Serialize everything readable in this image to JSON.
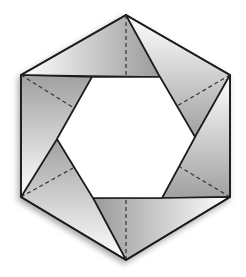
{
  "diagram": {
    "colors": {
      "stroke": "#1e1e1e",
      "paper_light": "#ffffff",
      "paper_dark": "#9a9a9a",
      "background": "#ffffff"
    },
    "outer_hexagon": [
      [
        126,
        15
      ],
      [
        230,
        75
      ],
      [
        230,
        197
      ],
      [
        126,
        260
      ],
      [
        21,
        197
      ],
      [
        21,
        75
      ]
    ],
    "inner_hexagon": [
      [
        92,
        77
      ],
      [
        160,
        77
      ],
      [
        195,
        137
      ],
      [
        162,
        198
      ],
      [
        93,
        198
      ],
      [
        57,
        139
      ]
    ],
    "dashed_folds": [
      [
        [
          126,
          15
        ],
        [
          126,
          77
        ]
      ],
      [
        [
          230,
          75
        ],
        [
          177,
          106
        ]
      ],
      [
        [
          230,
          197
        ],
        [
          178,
          167
        ]
      ],
      [
        [
          126,
          260
        ],
        [
          126,
          198
        ]
      ],
      [
        [
          21,
          197
        ],
        [
          75,
          168
        ]
      ],
      [
        [
          21,
          75
        ],
        [
          74,
          108
        ]
      ]
    ]
  }
}
